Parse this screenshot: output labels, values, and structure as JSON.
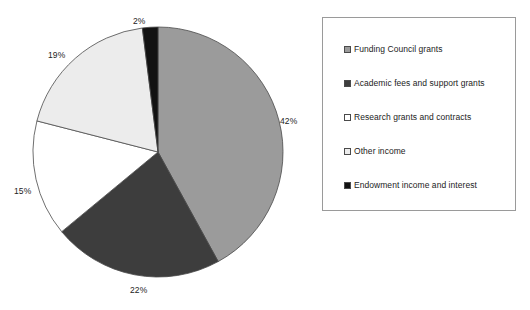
{
  "chart_data": {
    "type": "pie",
    "title": "",
    "subtitle": "",
    "xlabel": "",
    "ylabel": "",
    "legend_position": "right",
    "grid": false,
    "start_angle_deg": 0,
    "direction": "clockwise",
    "categories": [
      "Funding Council grants",
      "Academic fees and support grants",
      "Research grants and contracts",
      "Other income",
      "Endowment income and interest"
    ],
    "values": [
      42,
      22,
      15,
      19,
      2
    ],
    "value_unit": "%",
    "colors": [
      "#9b9b9b",
      "#3d3d3d",
      "#ffffff",
      "#ececec",
      "#121212"
    ],
    "slices": [
      {
        "label": "Funding Council grants",
        "value": 42,
        "display": "42%",
        "color": "#9b9b9b"
      },
      {
        "label": "Academic fees and support grants",
        "value": 22,
        "display": "22%",
        "color": "#3d3d3d"
      },
      {
        "label": "Research grants and contracts",
        "value": 15,
        "display": "15%",
        "color": "#ffffff"
      },
      {
        "label": "Other income",
        "value": 19,
        "display": "19%",
        "color": "#ececec"
      },
      {
        "label": "Endowment income and interest",
        "value": 2,
        "display": "2%",
        "color": "#121212"
      }
    ],
    "data_labels": [
      "42%",
      "22%",
      "15%",
      "19%",
      "2%"
    ]
  },
  "legend": {
    "items": [
      {
        "label": "Funding Council grants",
        "color": "#9b9b9b"
      },
      {
        "label": "Academic fees and support grants",
        "color": "#3d3d3d"
      },
      {
        "label": "Research grants and contracts",
        "color": "#ffffff"
      },
      {
        "label": "Other income",
        "color": "#ececec"
      },
      {
        "label": "Endowment income and interest",
        "color": "#121212"
      }
    ]
  },
  "style": {
    "slice_outline": "#4a4a4a",
    "legend_border": "#9a9a9a",
    "label_color": "#232323",
    "background": "#ffffff"
  }
}
